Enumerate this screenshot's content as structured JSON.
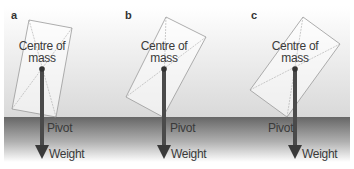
{
  "panels": [
    {
      "letter": "a",
      "centre_label": "Centre of",
      "centre_label2": "mass",
      "pivot_label": "Pivot",
      "weight_label": "Weight"
    },
    {
      "letter": "b",
      "centre_label": "Centre of",
      "centre_label2": "mass",
      "pivot_label": "Pivot",
      "weight_label": "Weight"
    },
    {
      "letter": "c",
      "centre_label": "Centre of",
      "centre_label2": "mass",
      "pivot_label": "Pivot",
      "weight_label": "Weight"
    }
  ],
  "colors": {
    "arrow": "#4a4a4a",
    "ground_top": "#6b6b6b",
    "ground_bottom": "#ffffff",
    "background_top": "#ffffff",
    "background_bottom": "#dcdcdc"
  }
}
